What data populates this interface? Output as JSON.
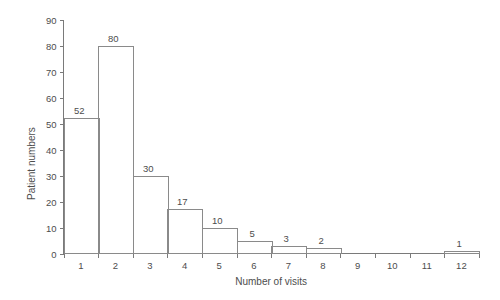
{
  "chart_data": {
    "type": "bar",
    "title": "",
    "xlabel": "Number of visits",
    "ylabel": "Patient numbers",
    "categories": [
      "1",
      "2",
      "3",
      "4",
      "5",
      "6",
      "7",
      "8",
      "9",
      "10",
      "11",
      "12"
    ],
    "values": [
      52,
      80,
      30,
      17,
      10,
      5,
      3,
      2,
      0,
      0,
      0,
      1
    ],
    "value_labels": [
      "52",
      "80",
      "30",
      "17",
      "10",
      "5",
      "3",
      "2",
      "",
      "",
      "",
      "1"
    ],
    "ylim": [
      0,
      90
    ],
    "ytick_labels": [
      "0",
      "10",
      "20",
      "30",
      "40",
      "50",
      "60",
      "70",
      "80",
      "90"
    ],
    "ytick_values": [
      0,
      10,
      20,
      30,
      40,
      50,
      60,
      70,
      80,
      90
    ],
    "grid": false,
    "legend": false,
    "legend_position": "none",
    "bar_style": "outline",
    "colors": {
      "background": "#ffffff",
      "axis": "#7a7a7a",
      "bar_stroke": "#8a8a8a",
      "text": "#4d4d4d"
    }
  }
}
